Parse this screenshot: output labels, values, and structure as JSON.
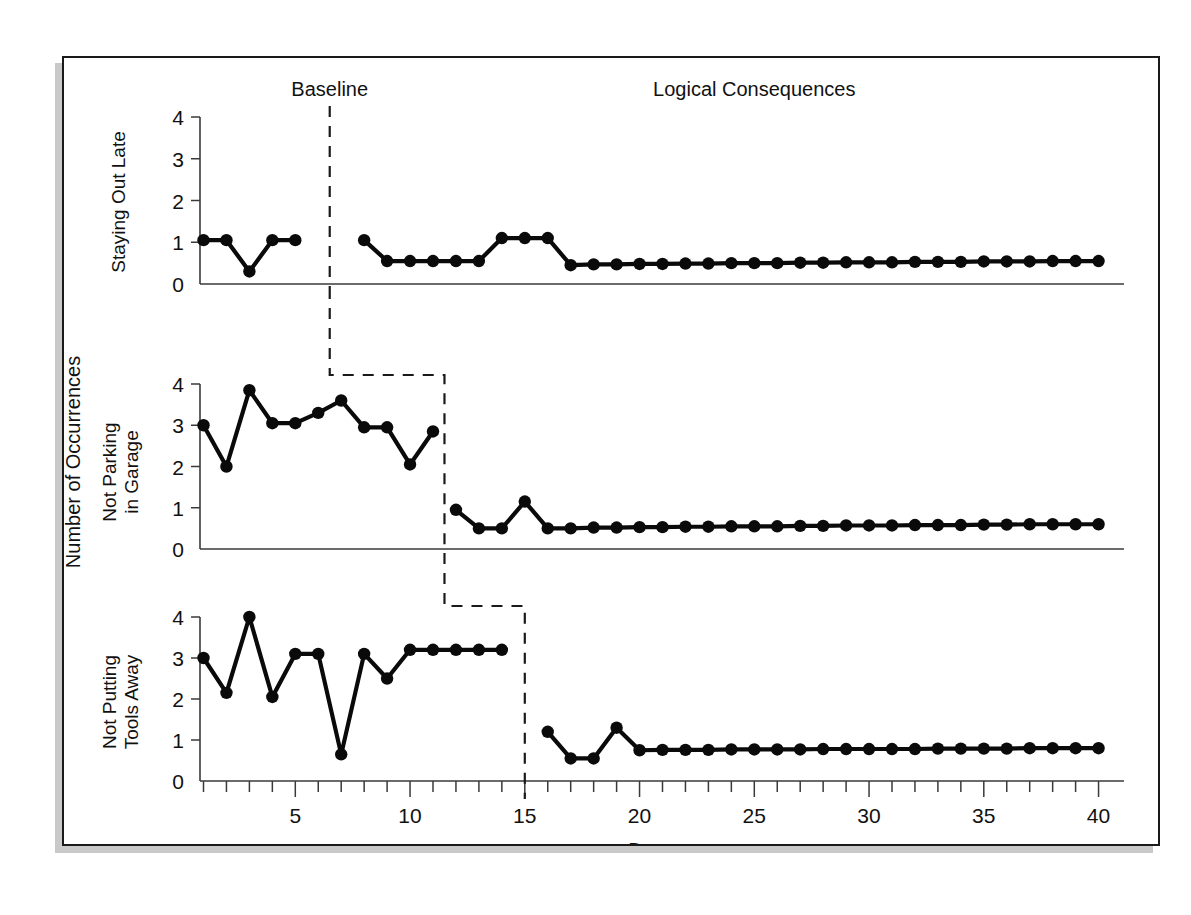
{
  "figure": {
    "phase_labels": {
      "baseline": "Baseline",
      "treatment": "Logical Consequences"
    },
    "y_axis_title": "Number of Occurrences",
    "x_axis_title": "Days",
    "y_tick_labels": [
      "0",
      "1",
      "2",
      "3",
      "4"
    ],
    "x_tick_labels": [
      "5",
      "10",
      "15",
      "20",
      "25",
      "30",
      "35",
      "40"
    ],
    "panel_labels": {
      "top": "Staying Out Late",
      "middle_line1": "Not Parking",
      "middle_line2": "in Garage",
      "bottom_line1": "Not Putting",
      "bottom_line2": "Tools Away"
    },
    "colors": {
      "line": "#0a0a0a",
      "axis": "#3a3a3a",
      "frame": "#1a1a1a",
      "background": "#ffffff"
    }
  },
  "chart_data": {
    "type": "line",
    "title": "",
    "subtitle": "",
    "xlabel": "Days",
    "ylabel": "Number of Occurrences",
    "xlim": [
      0,
      41
    ],
    "ylim": [
      0,
      4
    ],
    "grid": false,
    "legend": "none",
    "design": "multiple-baseline across behaviors",
    "phase_labels": [
      "Baseline",
      "Logical Consequences"
    ],
    "x_ticks_major": [
      5,
      10,
      15,
      20,
      25,
      30,
      35,
      40
    ],
    "y_ticks": [
      0,
      1,
      2,
      3,
      4
    ],
    "panels": [
      {
        "name": "Staying Out Late",
        "intervention_day": 6.5,
        "baseline": {
          "x": [
            1,
            2,
            3,
            4,
            5
          ],
          "y": [
            1.05,
            1.05,
            0.3,
            1.05,
            1.05
          ]
        },
        "treatment": {
          "x": [
            8,
            9,
            10,
            11,
            12,
            13,
            14,
            15,
            16,
            17,
            18,
            19,
            20,
            21,
            22,
            23,
            24,
            25,
            26,
            27,
            28,
            29,
            30,
            31,
            32,
            33,
            34,
            35,
            36,
            37,
            38,
            39,
            40
          ],
          "y": [
            1.05,
            0.55,
            0.55,
            0.55,
            0.55,
            0.55,
            1.1,
            1.1,
            1.1,
            0.45,
            0.47,
            0.47,
            0.48,
            0.48,
            0.49,
            0.49,
            0.5,
            0.5,
            0.5,
            0.51,
            0.51,
            0.52,
            0.52,
            0.52,
            0.53,
            0.53,
            0.53,
            0.54,
            0.54,
            0.54,
            0.55,
            0.55,
            0.55
          ]
        }
      },
      {
        "name": "Not Parking in Garage",
        "intervention_day": 11.5,
        "baseline": {
          "x": [
            1,
            2,
            3,
            4,
            5,
            6,
            7,
            8,
            9,
            10,
            11
          ],
          "y": [
            3.0,
            2.0,
            3.85,
            3.05,
            3.05,
            3.3,
            3.6,
            2.95,
            2.95,
            2.05,
            2.85
          ]
        },
        "treatment": {
          "x": [
            12,
            13,
            14,
            15,
            16,
            17,
            18,
            19,
            20,
            21,
            22,
            23,
            24,
            25,
            26,
            27,
            28,
            29,
            30,
            31,
            32,
            33,
            34,
            35,
            36,
            37,
            38,
            39,
            40
          ],
          "y": [
            0.95,
            0.5,
            0.5,
            1.15,
            0.5,
            0.5,
            0.52,
            0.52,
            0.53,
            0.53,
            0.54,
            0.54,
            0.55,
            0.55,
            0.55,
            0.56,
            0.56,
            0.57,
            0.57,
            0.57,
            0.58,
            0.58,
            0.58,
            0.59,
            0.59,
            0.6,
            0.6,
            0.6,
            0.6
          ]
        }
      },
      {
        "name": "Not Putting Tools Away",
        "intervention_day": 15.0,
        "baseline": {
          "x": [
            1,
            2,
            3,
            4,
            5,
            6,
            7,
            8,
            9,
            10,
            11,
            12,
            13,
            14
          ],
          "y": [
            3.0,
            2.15,
            4.0,
            2.05,
            3.1,
            3.1,
            0.65,
            3.1,
            2.5,
            3.2,
            3.2,
            3.2,
            3.2,
            3.2
          ]
        },
        "treatment": {
          "x": [
            16,
            17,
            18,
            19,
            20,
            21,
            22,
            23,
            24,
            25,
            26,
            27,
            28,
            29,
            30,
            31,
            32,
            33,
            34,
            35,
            36,
            37,
            38,
            39,
            40
          ],
          "y": [
            1.2,
            0.55,
            0.55,
            1.3,
            0.75,
            0.76,
            0.76,
            0.76,
            0.77,
            0.77,
            0.77,
            0.77,
            0.78,
            0.78,
            0.78,
            0.78,
            0.78,
            0.79,
            0.79,
            0.79,
            0.79,
            0.8,
            0.8,
            0.8,
            0.8
          ]
        }
      }
    ]
  }
}
